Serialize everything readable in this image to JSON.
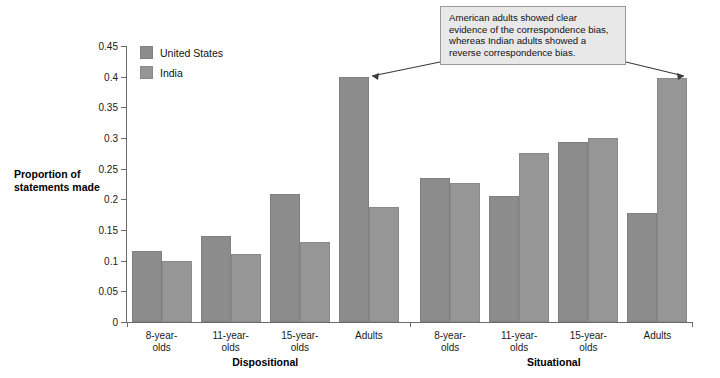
{
  "chart_data": {
    "type": "bar",
    "title": "",
    "xlabel": "",
    "ylabel": "Proportion of statements made",
    "ylim": [
      0,
      0.45
    ],
    "ytick_labels": [
      "0",
      "0.05",
      "0.1",
      "0.15",
      "0.2",
      "0.25",
      "0.3",
      "0.35",
      "0.4",
      "0.45"
    ],
    "ytick_values": [
      0,
      0.05,
      0.1,
      0.15,
      0.2,
      0.25,
      0.3,
      0.35,
      0.4,
      0.45
    ],
    "grid": false,
    "legend_position": "top-left inside plot",
    "groups": [
      {
        "name": "Dispositional",
        "categories": [
          "8-year-\nolds",
          "11-year-\nolds",
          "15-year-\nolds",
          "Adults"
        ]
      },
      {
        "name": "Situational",
        "categories": [
          "8-year-\nolds",
          "11-year-\nolds",
          "15-year-\nolds",
          "Adults"
        ]
      }
    ],
    "categories": [
      "8-year-olds",
      "11-year-olds",
      "15-year-olds",
      "Adults",
      "8-year-olds",
      "11-year-olds",
      "15-year-olds",
      "Adults"
    ],
    "series": [
      {
        "name": "United States",
        "color": "#8c8c8c",
        "values": [
          0.115,
          0.141,
          0.208,
          0.4,
          0.235,
          0.205,
          0.293,
          0.178
        ]
      },
      {
        "name": "India",
        "color": "#969696",
        "values": [
          0.1,
          0.111,
          0.13,
          0.188,
          0.227,
          0.275,
          0.3,
          0.398
        ]
      }
    ],
    "annotations": [
      {
        "text": "American adults showed clear evidence of the correspondence bias, whereas Indian adults showed a reverse correspondence bias.",
        "points_to": [
          "Dispositional / Adults / United States",
          "Situational / Adults / India"
        ]
      }
    ]
  },
  "legend": {
    "items": [
      {
        "label": "United States",
        "color": "#8c8c8c"
      },
      {
        "label": "India",
        "color": "#969696"
      }
    ]
  },
  "axis": {
    "y_title_line1": "Proportion of",
    "y_title_line2": "statements made"
  },
  "annotation": {
    "text": "American adults showed clear evidence of the correspondence bias, whereas Indian adults showed a reverse correspondence bias."
  }
}
